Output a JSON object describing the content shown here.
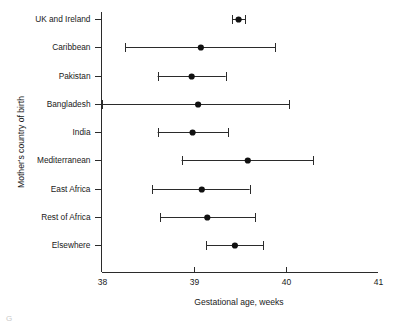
{
  "chart_data": {
    "type": "scatter",
    "title": "",
    "xlabel": "Gestational age, weeks",
    "ylabel": "Mother's country of birth",
    "xlim": [
      38,
      41
    ],
    "xticks": [
      38,
      39,
      40,
      41
    ],
    "xtick_labels": [
      "38",
      "39",
      "40",
      "41"
    ],
    "grid": false,
    "legend": "none",
    "orientation": "horizontal",
    "error_bars": "horizontal 95% confidence interval",
    "categories": [
      "UK and Ireland",
      "Caribbean",
      "Pakistan",
      "Bangladesh",
      "India",
      "Mediterranean",
      "East Africa",
      "Rest of Africa",
      "Elsewhere"
    ],
    "values": [
      39.49,
      39.08,
      38.98,
      39.05,
      38.99,
      39.59,
      39.09,
      39.15,
      39.45
    ],
    "ci_low": [
      39.42,
      38.26,
      38.61,
      38.0,
      38.61,
      38.87,
      38.55,
      38.64,
      39.14
    ],
    "ci_high": [
      39.56,
      39.89,
      39.35,
      40.04,
      39.38,
      40.3,
      39.61,
      39.67,
      39.76
    ],
    "points": [
      {
        "category": "UK and Ireland",
        "value": 39.49,
        "ci_low": 39.42,
        "ci_high": 39.56
      },
      {
        "category": "Caribbean",
        "value": 39.08,
        "ci_low": 38.26,
        "ci_high": 39.89
      },
      {
        "category": "Pakistan",
        "value": 38.98,
        "ci_low": 38.61,
        "ci_high": 39.35
      },
      {
        "category": "Bangladesh",
        "value": 39.05,
        "ci_low": 38.0,
        "ci_high": 40.04
      },
      {
        "category": "India",
        "value": 38.99,
        "ci_low": 38.61,
        "ci_high": 39.38
      },
      {
        "category": "Mediterranean",
        "value": 39.59,
        "ci_low": 38.87,
        "ci_high": 40.3
      },
      {
        "category": "East Africa",
        "value": 39.09,
        "ci_low": 38.55,
        "ci_high": 39.61
      },
      {
        "category": "Rest of Africa",
        "value": 39.15,
        "ci_low": 38.64,
        "ci_high": 39.67
      },
      {
        "category": "Elsewhere",
        "value": 39.45,
        "ci_low": 39.14,
        "ci_high": 39.76
      }
    ],
    "colors": {
      "marker": "#111111",
      "line": "#2b2b2b",
      "axis": "#2b2b2b",
      "background": "#ffffff"
    }
  },
  "caption": {
    "partial_text": "G"
  }
}
